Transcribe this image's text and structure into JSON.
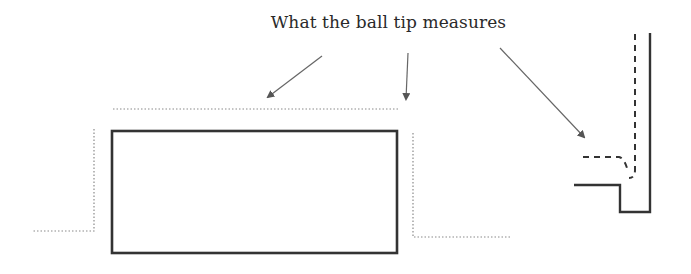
{
  "diagram": {
    "caption": "What the ball tip measures",
    "colors": {
      "solid_line": "#333333",
      "dotted_line": "#8a8a8a",
      "dashed_line": "#333333",
      "arrow": "#555555",
      "text": "#2a2a2a"
    },
    "elements": {
      "part_block": "solid rectangle (part cross-section)",
      "measured_profile_left": "dotted offset profile, left step",
      "measured_profile_top": "dotted offset line above block",
      "measured_profile_right": "dotted offset profile, right step",
      "inner_corner_detail": "solid inner corner with dashed ball-tip path"
    },
    "arrows": [
      {
        "name": "arrow-to-top-profile-left",
        "from": [
          322,
          56
        ],
        "to": [
          266,
          99
        ]
      },
      {
        "name": "arrow-to-top-profile-right",
        "from": [
          408,
          53
        ],
        "to": [
          406,
          101
        ]
      },
      {
        "name": "arrow-to-corner-detail",
        "from": [
          500,
          48
        ],
        "to": [
          586,
          139
        ]
      }
    ]
  }
}
